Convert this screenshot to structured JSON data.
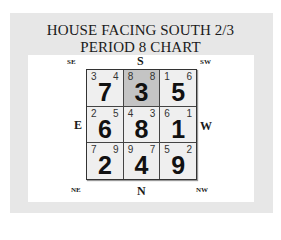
{
  "title": {
    "line1": "HOUSE FACING SOUTH 2/3",
    "line2": "PERIOD 8 CHART"
  },
  "directions": {
    "top": "S",
    "bottom": "N",
    "left": "E",
    "right": "W",
    "top_left": "SE",
    "top_right": "SW",
    "bottom_left": "NE",
    "bottom_right": "NW"
  },
  "highlight_color": "#c4c4c4",
  "cells": [
    {
      "mountain": "3",
      "facing": "4",
      "base": "7",
      "highlighted": false
    },
    {
      "mountain": "8",
      "facing": "8",
      "base": "3",
      "highlighted": true
    },
    {
      "mountain": "1",
      "facing": "6",
      "base": "5",
      "highlighted": false
    },
    {
      "mountain": "2",
      "facing": "5",
      "base": "6",
      "highlighted": false
    },
    {
      "mountain": "4",
      "facing": "3",
      "base": "8",
      "highlighted": false
    },
    {
      "mountain": "6",
      "facing": "1",
      "base": "1",
      "highlighted": false
    },
    {
      "mountain": "7",
      "facing": "9",
      "base": "2",
      "highlighted": false
    },
    {
      "mountain": "9",
      "facing": "7",
      "base": "4",
      "highlighted": false
    },
    {
      "mountain": "5",
      "facing": "2",
      "base": "9",
      "highlighted": false
    }
  ]
}
